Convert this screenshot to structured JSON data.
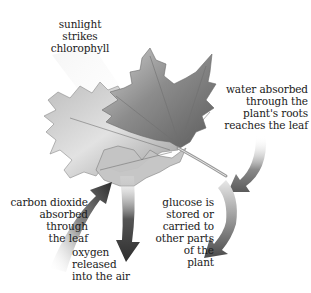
{
  "diagram": {
    "labels": {
      "sunlight": "sunlight\nstrikes\nchlorophyll",
      "water": "water absorbed\nthrough the\nplant's roots\nreaches the leaf",
      "carbon_dioxide": "carbon dioxide\nabsorbed\nthrough\nthe leaf",
      "oxygen": "oxygen\nreleased\ninto the air",
      "glucose": "glucose is\nstored or\ncarried to\nother parts\nof the\nplant"
    },
    "arrows": [
      {
        "id": "sunlight-beam",
        "direction": "down-right",
        "from": "top-left",
        "to": "leaf"
      },
      {
        "id": "water-arrow",
        "direction": "down-left",
        "from": "right",
        "to": "leaf stem"
      },
      {
        "id": "carbon-dioxide-arrow",
        "direction": "up-right",
        "from": "bottom-left",
        "to": "leaf"
      },
      {
        "id": "oxygen-arrow",
        "direction": "down",
        "from": "leaf",
        "to": "air"
      },
      {
        "id": "glucose-arrow",
        "direction": "down-left",
        "from": "leaf stem",
        "to": "plant"
      }
    ],
    "colors": {
      "background": "#ffffff",
      "text": "#1a1a1a",
      "leaf_dark": "#6e6e6e",
      "leaf_light": "#d8d8d8",
      "arrow_dark": "#3a3a3a",
      "arrow_light": "#e6e6e6"
    }
  }
}
